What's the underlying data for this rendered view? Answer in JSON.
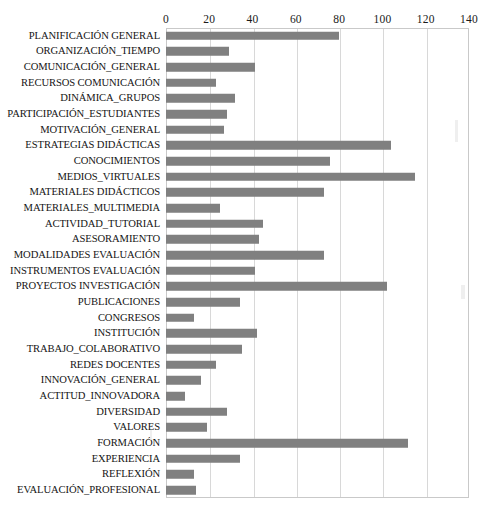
{
  "chart_data": {
    "type": "bar",
    "orientation": "horizontal",
    "title": "",
    "xlabel": "",
    "ylabel": "",
    "xlim": [
      0,
      140
    ],
    "xticks": [
      0,
      20,
      40,
      60,
      80,
      100,
      120,
      140
    ],
    "grid": true,
    "legend": false,
    "bar_color": "#808080",
    "categories": [
      "PLANIFICACIÓN GENERAL",
      "ORGANIZACIÓN_TIEMPO",
      "COMUNICACIÓN_GENERAL",
      "RECURSOS COMUNICACIÓN",
      "DINÁMICA_GRUPOS",
      "PARTICIPACIÓN_ESTUDIANTES",
      "MOTIVACIÓN_GENERAL",
      "ESTRATEGIAS DIDÁCTICAS",
      "CONOCIMIENTOS",
      "MEDIOS_VIRTUALES",
      "MATERIALES DIDÁCTICOS",
      "MATERIALES_MULTIMEDIA",
      "ACTIVIDAD_TUTORIAL",
      "ASESORAMIENTO",
      "MODALIDADES EVALUACIÓN",
      "INSTRUMENTOS EVALUACIÓN",
      "PROYECTOS INVESTIGACIÓN",
      "PUBLICACIONES",
      "CONGRESOS",
      "INSTITUCIÓN",
      "TRABAJO_COLABORATIVO",
      "REDES DOCENTES",
      "INNOVACIÓN_GENERAL",
      "ACTITUD_INNOVADORA",
      "DIVERSIDAD",
      "VALORES",
      "FORMACIÓN",
      "EXPERIENCIA",
      "REFLEXIÓN",
      "EVALUACIÓN_PROFESIONAL"
    ],
    "values": [
      80,
      29,
      41,
      23,
      32,
      28,
      27,
      104,
      76,
      115,
      73,
      25,
      45,
      43,
      73,
      41,
      102,
      34,
      13,
      42,
      35,
      23,
      16,
      9,
      28,
      19,
      112,
      34,
      13,
      14
    ]
  }
}
